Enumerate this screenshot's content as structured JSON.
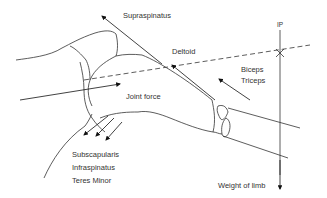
{
  "diagram": {
    "labels": {
      "supraspinatus": "Supraspinatus",
      "deltoid": "Deltoid",
      "ip": "IP",
      "biceps": "Biceps",
      "triceps": "Triceps",
      "joint_force": "Joint force",
      "subscapularis": "Subscapularis",
      "infraspinatus": "Infraspinatus",
      "teres_minor": "Teres Minor",
      "weight_of_limb": "Weight of limb"
    },
    "colors": {
      "stroke": "#222222",
      "text": "#333333",
      "background": "#ffffff"
    }
  }
}
